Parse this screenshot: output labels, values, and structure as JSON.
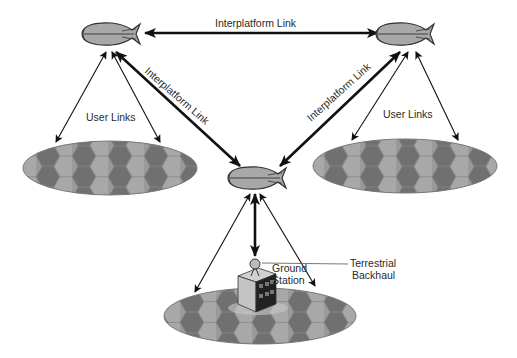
{
  "diagram": {
    "type": "network architecture",
    "labels": {
      "interplatform_top": "Interplatform Link",
      "interplatform_left": "Interplatform Link",
      "interplatform_right": "Interplatform Link",
      "user_links_left": "User Links",
      "user_links_right": "User Links",
      "ground_station_line1": "Ground",
      "ground_station_line2": "Station",
      "backhaul_line1": "Terrestrial",
      "backhaul_line2": "Backhaul"
    },
    "nodes": [
      {
        "id": "platform-left",
        "kind": "airship",
        "x": 110,
        "y": 34
      },
      {
        "id": "platform-right",
        "kind": "airship",
        "x": 415,
        "y": 34
      },
      {
        "id": "platform-center",
        "kind": "airship",
        "x": 262,
        "y": 178
      },
      {
        "id": "coverage-left",
        "kind": "coverage-area",
        "x": 110,
        "y": 168
      },
      {
        "id": "coverage-right",
        "kind": "coverage-area",
        "x": 405,
        "y": 166
      },
      {
        "id": "coverage-bottom",
        "kind": "coverage-area",
        "x": 260,
        "y": 316
      },
      {
        "id": "ground-station",
        "kind": "building",
        "x": 258,
        "y": 290
      }
    ],
    "colors": {
      "airship_fill": "#a8a8a8",
      "airship_stroke": "#333333",
      "cell_light": "#a3a3a3",
      "cell_mid": "#8c8c8c",
      "cell_dark": "#6e6e6e",
      "arrow": "#111111"
    }
  }
}
